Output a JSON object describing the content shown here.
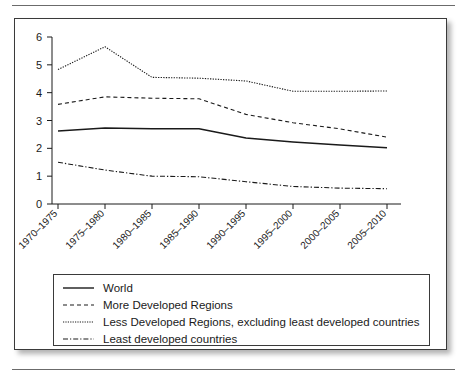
{
  "figure": {
    "has_top_rule": true,
    "has_bottom_rule": true
  },
  "chart_data": {
    "type": "line",
    "title": "",
    "xlabel": "",
    "ylabel": "",
    "categories": [
      "1970–1975",
      "1975–1980",
      "1980–1985",
      "1985–1990",
      "1990–1995",
      "1995–2000",
      "2000–2005",
      "2005–2010"
    ],
    "ylim": [
      0,
      6
    ],
    "yticks": [
      0,
      1,
      2,
      3,
      4,
      5,
      6
    ],
    "ytick_labels": [
      "0",
      "1",
      "2",
      "3",
      "4",
      "5",
      "6"
    ],
    "grid": false,
    "legend_position": "below-axes",
    "series": [
      {
        "name": "World",
        "style": "solid",
        "color": "#1a1a1a",
        "values": [
          2.62,
          2.73,
          2.7,
          2.7,
          2.37,
          2.23,
          2.12,
          2.02
        ]
      },
      {
        "name": "More Developed Regions",
        "style": "dashed",
        "color": "#1a1a1a",
        "values": [
          3.58,
          3.85,
          3.8,
          3.78,
          3.22,
          2.92,
          2.7,
          2.4
        ]
      },
      {
        "name": "Less Developed Regions, excluding least developed countries",
        "style": "dotted",
        "color": "#1a1a1a",
        "values": [
          4.83,
          5.65,
          4.55,
          4.52,
          4.42,
          4.05,
          4.05,
          4.06
        ]
      },
      {
        "name": "Least developed countries",
        "style": "dashdot",
        "color": "#1a1a1a",
        "values": [
          1.5,
          1.22,
          1.0,
          0.98,
          0.8,
          0.63,
          0.57,
          0.55
        ]
      }
    ]
  },
  "legend": {
    "items": [
      {
        "label": "World",
        "style": "solid"
      },
      {
        "label": "More Developed Regions",
        "style": "dashed"
      },
      {
        "label": "Less Developed Regions, excluding least developed countries",
        "style": "dotted"
      },
      {
        "label": "Least developed countries",
        "style": "dashdot"
      }
    ]
  }
}
